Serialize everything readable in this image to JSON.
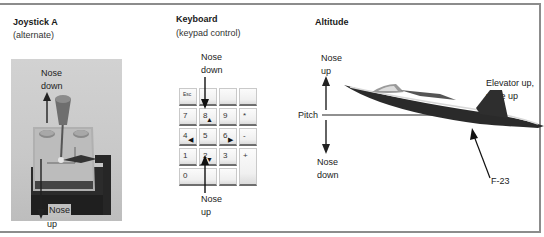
{
  "panels": {
    "joystick": {
      "title": "Joystick A",
      "subtitle": "(alternate)",
      "labels": {
        "top_line1": "Nose",
        "top_line2": "down",
        "bottom_line1": "Nose",
        "bottom_line2": "up"
      }
    },
    "keyboard": {
      "title": "Keyboard",
      "subtitle": "(keypad control)",
      "labels": {
        "top_line1": "Nose",
        "top_line2": "down",
        "bottom_line1": "Nose",
        "bottom_line2": "up"
      },
      "keys": [
        {
          "label": "Esc",
          "marker": ""
        },
        {
          "label": "",
          "marker": ""
        },
        {
          "label": "",
          "marker": ""
        },
        {
          "label": "",
          "marker": ""
        },
        {
          "label": "7",
          "marker": ""
        },
        {
          "label": "8",
          "marker": "▲"
        },
        {
          "label": "9",
          "marker": ""
        },
        {
          "label": "*",
          "marker": ""
        },
        {
          "label": "4",
          "marker": "◀"
        },
        {
          "label": "5",
          "marker": ""
        },
        {
          "label": "6",
          "marker": "▶"
        },
        {
          "label": "-",
          "marker": ""
        },
        {
          "label": "1",
          "marker": ""
        },
        {
          "label": "2",
          "marker": "▼"
        },
        {
          "label": "3",
          "marker": ""
        },
        {
          "label": "+",
          "marker": ""
        },
        {
          "label": "0",
          "marker": ""
        },
        {
          "label": "",
          "marker": ""
        }
      ]
    },
    "altitude": {
      "title": "Altitude",
      "labels": {
        "up_line1": "Nose",
        "up_line2": "up",
        "pitch": "Pitch",
        "down_line1": "Nose",
        "down_line2": "down",
        "elevator_line1": "Elevator up,",
        "elevator_line2": "nose up",
        "aircraft": "F-23"
      }
    }
  },
  "colors": {
    "frame": "#8c8c8c",
    "ink": "#1a1a1a",
    "photo_bg": "#c8c8c8",
    "aircraft_dark": "#2a2a2a"
  }
}
